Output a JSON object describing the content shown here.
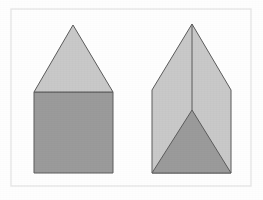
{
  "figure": {
    "canvas": {
      "width": 263,
      "height": 200,
      "background_color": "#fefefe"
    },
    "frame": {
      "label": "figure-border",
      "x": 11,
      "y": 9,
      "width": 240,
      "height": 177,
      "stroke_color": "#e6e6e6",
      "stroke_width": 1.4,
      "fill": "none"
    },
    "colors": {
      "light_gray": "#c8c8c8",
      "dark_gray": "#9a9a9a",
      "outline": "#5a5a5a",
      "frame": "#e6e6e6",
      "background": "#fefefe"
    },
    "shapes": [
      {
        "id": "left-figure",
        "name": "house-shape-square-with-triangle-roof",
        "description": "Light gray triangle resting on a darker gray square",
        "parts": [
          {
            "id": "left-square",
            "name": "square-body",
            "type": "polygon",
            "fill": "#9a9a9a",
            "stroke": "#5a5a5a",
            "stroke_width": 1,
            "points": "34,92 113,92 113,173 34,173"
          },
          {
            "id": "left-triangle",
            "name": "triangle-roof",
            "type": "polygon",
            "fill": "#c8c8c8",
            "stroke": "#5a5a5a",
            "stroke_width": 1,
            "points": "73,25 113,92 34,92"
          }
        ]
      },
      {
        "id": "right-figure",
        "name": "pentagon-with-inscribed-triangle",
        "description": "Light gray pentagon outline containing a dark gray triangle rising from the base, with a vertical crease from the apex",
        "parts": [
          {
            "id": "right-pentagon",
            "name": "pentagon-body",
            "type": "polygon",
            "fill": "#c8c8c8",
            "stroke": "#5a5a5a",
            "stroke_width": 1,
            "points": "192,24 231,90 231,173 152,173 152,90"
          },
          {
            "id": "right-inner-triangle",
            "name": "inner-dark-triangle",
            "type": "polygon",
            "fill": "#9a9a9a",
            "stroke": "#5a5a5a",
            "stroke_width": 1,
            "points": "192,110 231,173 152,173"
          },
          {
            "id": "right-crease",
            "name": "vertical-crease-line",
            "type": "line",
            "stroke": "#5a5a5a",
            "stroke_width": 1,
            "x1": 192,
            "y1": 24,
            "x2": 192,
            "y2": 110
          }
        ]
      }
    ]
  }
}
